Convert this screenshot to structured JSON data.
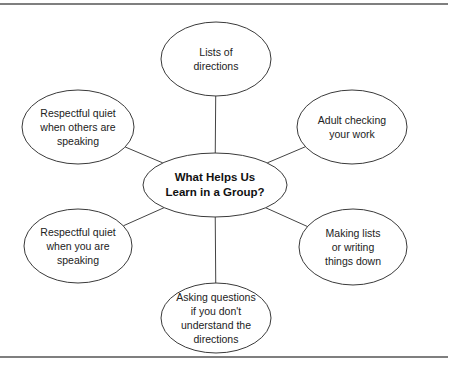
{
  "diagram": {
    "type": "concept-web",
    "center": {
      "lines": [
        "What Helps Us",
        "Learn in a Group?"
      ],
      "cx": 215,
      "cy": 185,
      "rx": 72,
      "ry": 32
    },
    "nodes": [
      {
        "id": "top",
        "lines": [
          "Lists of",
          "directions"
        ],
        "cx": 216,
        "cy": 59,
        "rx": 55,
        "ry": 37
      },
      {
        "id": "top-left",
        "lines": [
          "Respectful quiet",
          "when others are",
          "speaking"
        ],
        "cx": 78,
        "cy": 127,
        "rx": 56,
        "ry": 37
      },
      {
        "id": "top-right",
        "lines": [
          "Adult checking",
          "your work"
        ],
        "cx": 352,
        "cy": 127,
        "rx": 55,
        "ry": 37
      },
      {
        "id": "bottom-left",
        "lines": [
          "Respectful quiet",
          "when you are",
          "speaking"
        ],
        "cx": 78,
        "cy": 246,
        "rx": 54,
        "ry": 37
      },
      {
        "id": "bottom-right",
        "lines": [
          "Making lists",
          "or writing",
          "things down"
        ],
        "cx": 353,
        "cy": 247,
        "rx": 54,
        "ry": 38
      },
      {
        "id": "bottom",
        "lines": [
          "Asking questions",
          "if you don't",
          "understand the",
          "directions"
        ],
        "cx": 216,
        "cy": 318,
        "rx": 55,
        "ry": 35
      }
    ],
    "colors": {
      "stroke": "#3a3a3a",
      "text": "#222222",
      "background": "#ffffff"
    }
  }
}
